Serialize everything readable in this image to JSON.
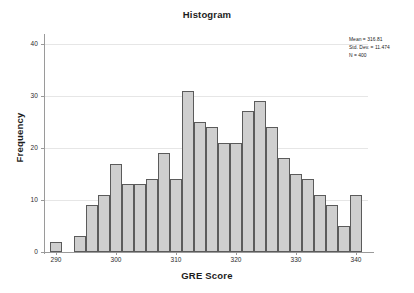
{
  "chart_data": {
    "type": "bar",
    "title": "Histogram",
    "xlabel": "GRE Score",
    "ylabel": "Frequency",
    "xlim": [
      288,
      342
    ],
    "ylim": [
      0,
      41.5
    ],
    "grid": true,
    "legend": null,
    "bin_width": 2,
    "x_ticks": [
      290,
      300,
      310,
      320,
      330,
      340
    ],
    "y_ticks": [
      0,
      10,
      20,
      30,
      40
    ],
    "categories": [
      290,
      294,
      296,
      298,
      300,
      302,
      304,
      306,
      308,
      310,
      312,
      314,
      316,
      318,
      320,
      322,
      324,
      326,
      328,
      330,
      332,
      334,
      336,
      338,
      340
    ],
    "bin_centers": [
      290,
      294,
      296,
      298,
      300,
      302,
      304,
      306,
      308,
      310,
      312,
      314,
      316,
      318,
      320,
      322,
      324,
      326,
      328,
      330,
      332,
      334,
      336,
      338,
      340
    ],
    "values": [
      2,
      3,
      9,
      11,
      17,
      13,
      13,
      14,
      19,
      14,
      31,
      25,
      24,
      21,
      21,
      27,
      29,
      24,
      18,
      15,
      14,
      11,
      9,
      5,
      11
    ],
    "annotations": {
      "mean_label": "Mean = 316.81",
      "std_label": "Std. Dev. = 11.474",
      "n_label": "N = 400",
      "mean": 316.81,
      "std_dev": 11.474,
      "n": 400
    },
    "colors": {
      "bar_fill": "#cfcfcf",
      "bar_edge": "#5b5b5b",
      "gridline": "#e6e6e6",
      "axis": "#9a9a9a",
      "text": "#1c1c1c",
      "background": "#ffffff"
    }
  },
  "stats": {
    "mean_label": "Mean = 316.81",
    "std_label": "Std. Dev. = 11.474",
    "n_label": "N = 400"
  },
  "axis": {
    "title": "Histogram",
    "xlabel": "GRE Score",
    "ylabel": "Frequency",
    "y_tick_labels": [
      "0",
      "10",
      "20",
      "30",
      "40"
    ],
    "x_tick_labels": [
      "290",
      "300",
      "310",
      "320",
      "330",
      "340"
    ]
  }
}
